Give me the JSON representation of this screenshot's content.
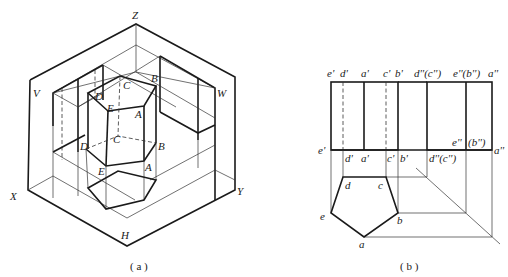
{
  "figure_a": {
    "caption": "( a )",
    "axis_labels": {
      "z": "Z",
      "x": "X",
      "y": "Y"
    },
    "plane_labels": {
      "v": "V",
      "w": "W",
      "h": "H"
    },
    "top_vertices": {
      "a": "A",
      "b": "B",
      "c": "C",
      "d": "D",
      "e": "E"
    },
    "mid_vertices": {
      "a": "A",
      "b": "B",
      "c": "C",
      "d": "D",
      "e": "E"
    }
  },
  "figure_b": {
    "caption": "( b )",
    "front_view_top_labels": [
      "e'",
      "d'",
      "a'",
      "c'",
      "b'"
    ],
    "side_view_top_labels": [
      "d''(c'')",
      "e''(b'')",
      "a''"
    ],
    "front_view_bottom_labels": [
      "e'",
      "d'",
      "a'",
      "c'",
      "b'"
    ],
    "side_view_bottom_labels": [
      "d''(c'')",
      "e''",
      "(b'')",
      "a''"
    ],
    "top_view_labels": {
      "a": "a",
      "b": "b",
      "c": "c",
      "d": "d",
      "e": "e"
    }
  }
}
